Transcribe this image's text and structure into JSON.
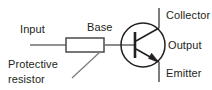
{
  "diagram": {
    "type": "circuit-schematic",
    "background_color": "#ffffff",
    "wire_color": "#6e6e6e",
    "symbol_color": "#231f20",
    "text_color": "#231f20"
  },
  "labels": {
    "input": "Input",
    "base": "Base",
    "collector": "Collector",
    "output": "Output",
    "emitter": "Emitter",
    "protective_resistor_line1": "Protective",
    "protective_resistor_line2": "resistor"
  },
  "components": [
    {
      "name": "protective-resistor",
      "symbol": "resistor-rectangle",
      "label": "Protective resistor"
    },
    {
      "name": "npn-transistor",
      "symbol": "bjt-npn",
      "terminals": [
        "Collector",
        "Base",
        "Emitter"
      ]
    }
  ],
  "nets": [
    {
      "name": "input-wire",
      "from": "Input",
      "to": "protective-resistor"
    },
    {
      "name": "base-wire",
      "from": "protective-resistor",
      "to": "Base"
    },
    {
      "name": "collector-wire",
      "from": "Collector",
      "to": "npn-transistor"
    },
    {
      "name": "emitter-wire",
      "from": "npn-transistor",
      "to": "Emitter"
    },
    {
      "name": "output-tap",
      "from": "Collector",
      "to": "Output"
    }
  ]
}
